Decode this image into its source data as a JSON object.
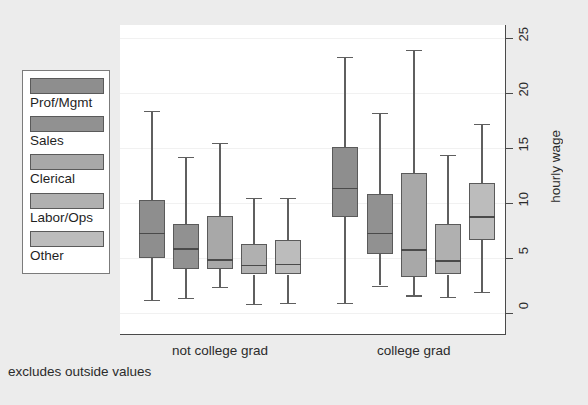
{
  "chart_data": {
    "type": "boxplot",
    "title": "",
    "xlabel": "",
    "ylabel": "hourly wage",
    "ylim": [
      0,
      25
    ],
    "y_ticks": [
      0,
      5,
      10,
      15,
      20,
      25
    ],
    "grid": true,
    "legend_position": "left-outside",
    "footnote": "excludes outside values",
    "groups": [
      {
        "label": "not college grad",
        "boxes": [
          {
            "series": "Prof/Mgmt",
            "whisker_low": 1.2,
            "q1": 5.0,
            "median": 7.3,
            "q3": 10.3,
            "whisker_high": 18.4
          },
          {
            "series": "Sales",
            "whisker_low": 1.4,
            "q1": 4.0,
            "median": 5.9,
            "q3": 8.1,
            "whisker_high": 14.2
          },
          {
            "series": "Clerical",
            "whisker_low": 2.4,
            "q1": 4.0,
            "median": 4.9,
            "q3": 8.8,
            "whisker_high": 15.5
          },
          {
            "series": "Labor/Ops",
            "whisker_low": 0.8,
            "q1": 3.5,
            "median": 4.4,
            "q3": 6.3,
            "whisker_high": 10.5
          },
          {
            "series": "Other",
            "whisker_low": 0.9,
            "q1": 3.5,
            "median": 4.5,
            "q3": 6.6,
            "whisker_high": 10.5
          }
        ]
      },
      {
        "label": "college grad",
        "boxes": [
          {
            "series": "Prof/Mgmt",
            "whisker_low": 0.9,
            "q1": 8.7,
            "median": 11.4,
            "q3": 15.1,
            "whisker_high": 23.3
          },
          {
            "series": "Sales",
            "whisker_low": 2.5,
            "q1": 5.4,
            "median": 7.3,
            "q3": 10.8,
            "whisker_high": 18.2
          },
          {
            "series": "Clerical",
            "whisker_low": 1.6,
            "q1": 3.3,
            "median": 5.8,
            "q3": 12.7,
            "whisker_high": 23.9
          },
          {
            "series": "Labor/Ops",
            "whisker_low": 1.5,
            "q1": 3.5,
            "median": 4.8,
            "q3": 8.1,
            "whisker_high": 14.4
          },
          {
            "series": "Other",
            "whisker_low": 1.9,
            "q1": 6.6,
            "median": 8.8,
            "q3": 11.8,
            "whisker_high": 17.2
          }
        ]
      }
    ]
  },
  "legend": {
    "items": [
      {
        "label": "Prof/Mgmt",
        "color": "#8e8e8e"
      },
      {
        "label": "Sales",
        "color": "#919191"
      },
      {
        "label": "Clerical",
        "color": "#a8a8a8"
      },
      {
        "label": "Labor/Ops",
        "color": "#b0b0b0"
      },
      {
        "label": "Other",
        "color": "#bcbcbc"
      }
    ]
  },
  "axis": {
    "y_title": "hourly wage",
    "y_tick_labels": [
      "0",
      "5",
      "10",
      "15",
      "20",
      "25"
    ]
  },
  "colors": {
    "background": "#ececec",
    "plot_background": "#ffffff",
    "axis": "#4a4a4a",
    "gridline": "#f1f1f1",
    "box_border": "#5a5a5a",
    "whisker": "#5f5f5f",
    "text": "#2b2b2b"
  },
  "footnote": "excludes outside values"
}
